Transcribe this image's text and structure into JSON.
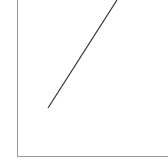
{
  "chart_data": {
    "type": "line",
    "title": "",
    "xlabel": "",
    "ylabel": "",
    "grid": false,
    "legend": null,
    "series": [
      {
        "name": "",
        "color": "#333333",
        "points": [
          [
            48,
            108
          ],
          [
            117,
            0
          ]
        ]
      }
    ]
  },
  "colors": {
    "axis": "#999999",
    "line": "#333333",
    "background": "#ffffff"
  }
}
